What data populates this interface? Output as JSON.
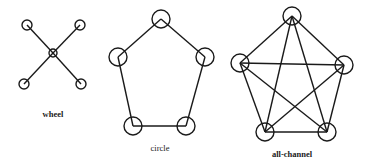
{
  "diagram": {
    "type": "communication-networks",
    "colors": {
      "background": "#ffffff",
      "ink": "#1a1a1a"
    },
    "networks": [
      {
        "id": "wheel",
        "label": "wheel",
        "label_pos": [
          53,
          117
        ],
        "label_bold": true,
        "node_radius": 5,
        "center_node": {
          "x": 53,
          "y": 53,
          "r": 4
        },
        "nodes": [
          {
            "x": 27,
            "y": 25
          },
          {
            "x": 80,
            "y": 25
          },
          {
            "x": 24,
            "y": 84
          },
          {
            "x": 81,
            "y": 84
          }
        ],
        "edges": [
          [
            0,
            "c"
          ],
          [
            1,
            "c"
          ],
          [
            2,
            "c"
          ],
          [
            3,
            "c"
          ]
        ]
      },
      {
        "id": "circle",
        "label": "circle",
        "label_pos": [
          160,
          151
        ],
        "label_bold": false,
        "node_radius": 9,
        "nodes": [
          {
            "x": 161,
            "y": 19
          },
          {
            "x": 118,
            "y": 57
          },
          {
            "x": 205,
            "y": 57
          },
          {
            "x": 133,
            "y": 126
          },
          {
            "x": 186,
            "y": 126
          }
        ],
        "edges": [
          [
            0,
            1
          ],
          [
            0,
            2
          ],
          [
            1,
            3
          ],
          [
            2,
            4
          ],
          [
            3,
            4
          ]
        ]
      },
      {
        "id": "all-channel",
        "label": "all-channel",
        "label_pos": [
          292,
          157
        ],
        "label_bold": true,
        "node_radius": 9,
        "nodes": [
          {
            "x": 292,
            "y": 16
          },
          {
            "x": 240,
            "y": 63
          },
          {
            "x": 344,
            "y": 65
          },
          {
            "x": 265,
            "y": 132
          },
          {
            "x": 327,
            "y": 132
          }
        ],
        "edges": [
          [
            0,
            1
          ],
          [
            0,
            2
          ],
          [
            0,
            3
          ],
          [
            0,
            4
          ],
          [
            1,
            2
          ],
          [
            1,
            3
          ],
          [
            1,
            4
          ],
          [
            2,
            3
          ],
          [
            2,
            4
          ],
          [
            3,
            4
          ]
        ]
      }
    ]
  }
}
